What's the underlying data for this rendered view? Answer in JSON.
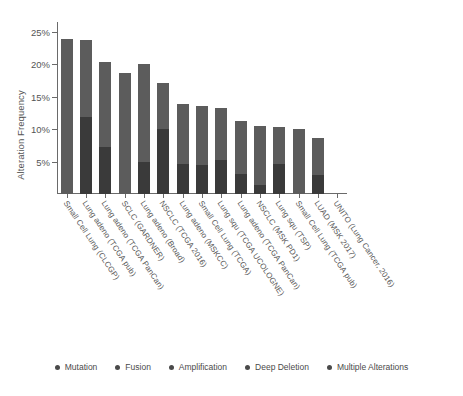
{
  "chart_data": {
    "type": "bar",
    "title": "",
    "xlabel": "",
    "ylabel": "Alteration Frequency",
    "ylim": [
      0,
      26.5
    ],
    "ytick_values": [
      5,
      10,
      15,
      20,
      25
    ],
    "ytick_labels": [
      "5%",
      "10%",
      "15%",
      "20%",
      "25%"
    ],
    "grid": false,
    "stacked": true,
    "legend_position": "bottom",
    "legend": [
      "Mutation",
      "Fusion",
      "Amplification",
      "Deep Deletion",
      "Multiple Alterations"
    ],
    "categories": [
      "Small Cell Lung (CLCGP)",
      "Lung adeno (TCGA pub)",
      "Lung adeno (TCGA PanCan)",
      "SCLC (GARDNER)",
      "Lung adeno (Broad)",
      "NSCLC (TCGA 2016)",
      "Lung adeno (MSKCC)",
      "Small Cell Lung (TCGA)",
      "Lung squ (TCGA UCOLOGNE)",
      "Lung adeno (TCGA PanCan)",
      "NSCLC (MSK PD1)",
      "Lung squ (TSP)",
      "Small Cell Lung (TCGA pub)",
      "LUAD (MSK 2017)",
      "UNITO (Lung Cancer, 2016)"
    ],
    "series": [
      {
        "name": "Multiple Alterations",
        "color": "#5c5c5c",
        "values": [
          23.9,
          11.9,
          20.3,
          18.6,
          20.0,
          17.1,
          13.9,
          13.6,
          13.3,
          11.3,
          10.5,
          10.4,
          10.0,
          8.6,
          0.0
        ]
      },
      {
        "name": "Mutation",
        "color": "#3a3a3a",
        "values": [
          0.0,
          11.9,
          7.2,
          0.0,
          5.0,
          10.0,
          4.6,
          4.5,
          5.3,
          3.1,
          1.4,
          4.6,
          0.0,
          3.0,
          0.0
        ]
      }
    ],
    "totals": [
      23.9,
      23.8,
      20.3,
      18.6,
      20.0,
      17.1,
      13.9,
      13.6,
      13.3,
      11.3,
      10.5,
      10.4,
      10.0,
      8.6,
      0.0
    ]
  },
  "legend": {
    "items": [
      {
        "label": "Mutation",
        "color": "#4a4a4a"
      },
      {
        "label": "Fusion",
        "color": "#4a4a4a"
      },
      {
        "label": "Amplification",
        "color": "#4a4a4a"
      },
      {
        "label": "Deep Deletion",
        "color": "#4a4a4a"
      },
      {
        "label": "Multiple Alterations",
        "color": "#4a4a4a"
      }
    ]
  },
  "axis": {
    "y_title": "Alteration Frequency"
  }
}
